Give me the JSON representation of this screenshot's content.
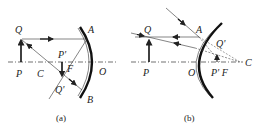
{
  "figure_a": {
    "caption": "(a)",
    "mirror_type": "concave",
    "labels": {
      "Q": "Q",
      "A": "A",
      "P_prime": "P'",
      "C": "C",
      "F": "F",
      "O": "O",
      "P": "P",
      "Q_prime": "Q'",
      "B": "B"
    }
  },
  "figure_b": {
    "caption": "(b)",
    "mirror_type": "convex",
    "labels": {
      "Q": "Q",
      "A": "A",
      "Q_prime": "Q'",
      "P": "P",
      "O": "O",
      "P_prime_F": "P' F",
      "C": "C"
    }
  },
  "colors": {
    "ink": "#222222",
    "background": "#ffffff"
  }
}
